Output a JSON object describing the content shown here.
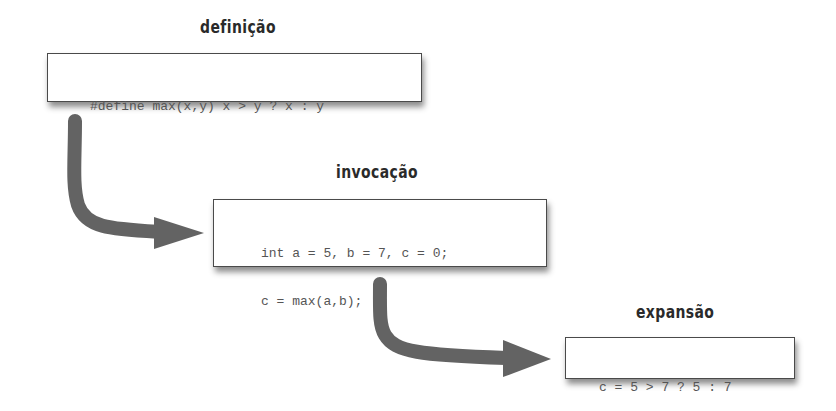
{
  "diagram": {
    "stages": [
      {
        "label": "definição",
        "code": [
          "#define max(x,y) x > y ? x : y"
        ]
      },
      {
        "label": "invocação",
        "code": [
          "int a = 5, b = 7, c = 0;",
          "c = max(a,b);"
        ]
      },
      {
        "label": "expansão",
        "code": [
          "c = 5 > 7 ? 5 : 7"
        ]
      }
    ],
    "arrows": [
      {
        "from": "definição",
        "to": "invocação"
      },
      {
        "from": "invocação",
        "to": "expansão"
      }
    ],
    "colors": {
      "arrow": "#636363",
      "box_border": "#4a4a4a",
      "code_text": "#555555",
      "label_text": "#2a2a2a"
    }
  }
}
